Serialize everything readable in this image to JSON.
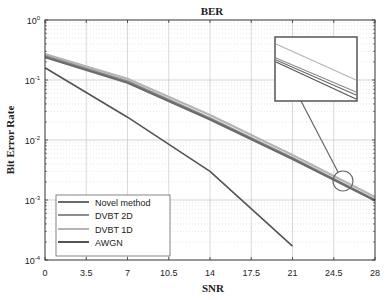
{
  "chart_data": {
    "type": "line",
    "title": "BER",
    "xlabel": "SNR",
    "ylabel": "Bit Error Rate",
    "xlim": [
      0,
      28
    ],
    "ylim": [
      0.0001,
      1
    ],
    "yscale": "log",
    "grid": true,
    "minor_grid": true,
    "legend_position": "lower left",
    "x_ticks": [
      "0",
      "3.5",
      "7",
      "10.5",
      "14",
      "17.5",
      "21",
      "24.5",
      "28"
    ],
    "y_ticks": [
      {
        "base": "10",
        "exp": "0"
      },
      {
        "base": "10",
        "exp": "-1"
      },
      {
        "base": "10",
        "exp": "-2"
      },
      {
        "base": "10",
        "exp": "-3"
      },
      {
        "base": "10",
        "exp": "-4"
      }
    ],
    "series": [
      {
        "name": "Novel method",
        "color": "#6b6b6b",
        "x": [
          0,
          7,
          14,
          21,
          28
        ],
        "values": [
          0.24,
          0.09,
          0.022,
          0.0048,
          0.00098
        ]
      },
      {
        "name": "DVBT 2D",
        "color": "#8c8c8c",
        "x": [
          0,
          7,
          14,
          21,
          28
        ],
        "values": [
          0.25,
          0.095,
          0.023,
          0.005,
          0.001
        ]
      },
      {
        "name": "DVBT 1D",
        "color": "#b4b4b4",
        "x": [
          0,
          7,
          14,
          21,
          28
        ],
        "values": [
          0.27,
          0.105,
          0.026,
          0.0056,
          0.00112
        ]
      },
      {
        "name": "AWGN",
        "color": "#545454",
        "x": [
          0,
          7,
          14,
          21
        ],
        "values": [
          0.16,
          0.024,
          0.003,
          0.00017
        ]
      }
    ],
    "annotations": [
      {
        "type": "zoom-circle",
        "x": 25.5,
        "y": 0.0023
      },
      {
        "type": "inset",
        "description": "magnified view of the three close curves near SNR 25.5"
      }
    ]
  }
}
